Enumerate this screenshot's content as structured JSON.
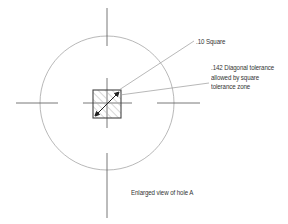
{
  "diagram": {
    "labels": {
      "square": ".10 Square",
      "diagonal_line1": ".142 Diagonal tolerance",
      "diagonal_line2": "allowed by square",
      "diagonal_line3": "tolerance zone",
      "caption": "Enlarged view of hole A"
    },
    "colors": {
      "stroke_dark": "#555555",
      "stroke_light": "#9a9a9a",
      "hatch": "#b0b0b0",
      "text": "#333333"
    },
    "geometry": {
      "center": [
        107,
        103
      ],
      "circle_radius": 67,
      "square": {
        "x": 93,
        "y": 90,
        "size": 28
      }
    }
  }
}
